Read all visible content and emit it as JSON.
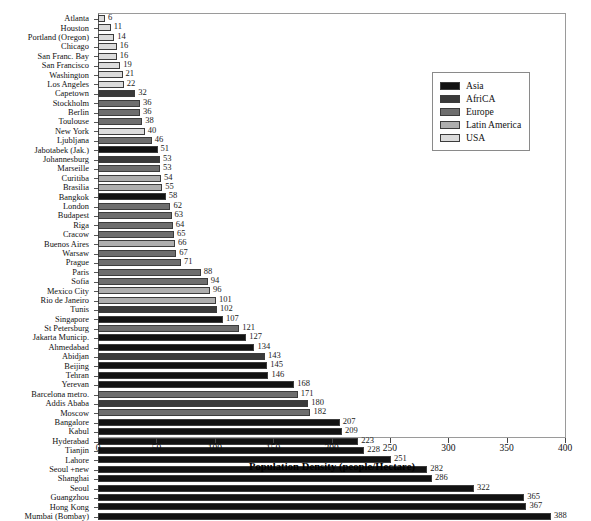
{
  "chart_data": {
    "type": "bar",
    "orientation": "horizontal",
    "title": "",
    "xlabel": "Population Density (people/Hectare)",
    "ylabel": "",
    "xlim": [
      0,
      400
    ],
    "xticks": [
      0,
      50,
      100,
      150,
      200,
      250,
      300,
      350,
      400
    ],
    "grid": false,
    "legend_position": "top-right",
    "legend": [
      {
        "name": "Asia",
        "color": "#121212"
      },
      {
        "name": "AfriCA",
        "color": "#3a3a3a"
      },
      {
        "name": "Europe",
        "color": "#6e6e6e"
      },
      {
        "name": "Latin America",
        "color": "#aeaeae"
      },
      {
        "name": "USA",
        "color": "#dcdcdc"
      }
    ],
    "categories": [
      "Atlanta",
      "Houston",
      "Portland (Oregon)",
      "Chicago",
      "San Franc. Bay",
      "San Francisco",
      "Washington",
      "Los Angeles",
      "Capetown",
      "Stockholm",
      "Berlin",
      "Toulouse",
      "New York",
      "Ljubljana",
      "Jabotabek (Jak.)",
      "Johannesburg",
      "Marseille",
      "Curitiba",
      "Brasilia",
      "Bangkok",
      "London",
      "Budapest",
      "Riga",
      "Cracow",
      "Buenos Aires",
      "Warsaw",
      "Prague",
      "Paris",
      "Sofia",
      "Mexico City",
      "Rio de Janeiro",
      "Tunis",
      "Singapore",
      "St Petersburg",
      "Jakarta Municip.",
      "Ahmedabad",
      "Abidjan",
      "Beijing",
      "Tehran",
      "Yerevan",
      "Barcelona metro.",
      "Addis Ababa",
      "Moscow",
      "Bangalore",
      "Kabul",
      "Hyderabad",
      "Tianjin",
      "Lahore",
      "Seoul +new",
      "Shanghai",
      "Seoul",
      "Guangzhou",
      "Hong Kong",
      "Mumbai (Bombay)"
    ],
    "values": [
      6,
      11,
      14,
      16,
      16,
      19,
      21,
      22,
      32,
      36,
      36,
      38,
      40,
      46,
      51,
      53,
      53,
      54,
      55,
      58,
      62,
      63,
      64,
      65,
      66,
      67,
      71,
      88,
      94,
      96,
      101,
      102,
      107,
      121,
      127,
      134,
      143,
      145,
      146,
      168,
      171,
      180,
      182,
      207,
      209,
      223,
      228,
      251,
      282,
      286,
      322,
      365,
      367,
      388
    ],
    "value_labels": [
      "6",
      "11",
      "14",
      "16",
      "16",
      "19",
      "21",
      "22",
      "32",
      "36",
      "36",
      "38",
      "40",
      "46",
      "51",
      "53",
      "53",
      "54",
      "55",
      "58",
      "62",
      "63",
      "64",
      "65",
      "66",
      "67",
      "71",
      "88",
      "94",
      "96",
      "101",
      "102",
      "107",
      "121",
      "127",
      "134",
      "143",
      "145",
      "146",
      "168",
      "171",
      "180",
      "182",
      "207",
      "209",
      "223",
      "228",
      "251",
      "282",
      "286",
      "322",
      "365",
      "367",
      "388"
    ],
    "regions": [
      "USA",
      "USA",
      "USA",
      "USA",
      "USA",
      "USA",
      "USA",
      "USA",
      "AfriCA",
      "Europe",
      "Europe",
      "Europe",
      "USA",
      "Europe",
      "Asia",
      "AfriCA",
      "Europe",
      "Latin America",
      "Latin America",
      "Asia",
      "Europe",
      "Europe",
      "Europe",
      "Europe",
      "Latin America",
      "Europe",
      "Europe",
      "Europe",
      "Europe",
      "Latin America",
      "Latin America",
      "AfriCA",
      "Asia",
      "Europe",
      "Asia",
      "Asia",
      "AfriCA",
      "Asia",
      "Asia",
      "Asia",
      "Europe",
      "AfriCA",
      "Europe",
      "Asia",
      "Asia",
      "Asia",
      "Asia",
      "Asia",
      "Asia",
      "Asia",
      "Asia",
      "Asia",
      "Asia",
      "Asia"
    ]
  }
}
